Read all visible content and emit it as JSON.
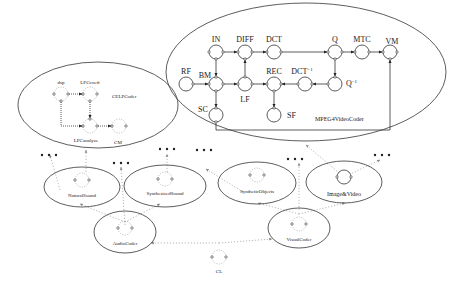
{
  "diagram": {
    "mpeg4": {
      "title": "MPEG4VideoCoder",
      "nodes": {
        "IN": "IN",
        "DIFF": "DIFF",
        "DCT": "DCT",
        "Q": "Q",
        "MTC": "MTC",
        "VM": "VM",
        "RF": "RF",
        "BM": "BM",
        "LF": "LF",
        "REC": "REC",
        "DCTinv": "DCT",
        "DCTinv_sup": "−1",
        "Qinv": "Q",
        "Qinv_sup": "−1",
        "SC": "SC",
        "SF": "SF"
      }
    },
    "celp": {
      "title": "CELPCoder",
      "nodes": {
        "dsp": "dsp",
        "LPCcoeff": "LPCcoeff",
        "LPCanalyze": "LPCanalyze",
        "CM": "CM"
      }
    },
    "hierarchy": {
      "natural_sound": "NaturalSound",
      "synthesized_sound": "SynthesizedSound",
      "synthetic_objects": "SyntheticObjects",
      "image_video": "Image&Video",
      "audio_coder": "AudioCoder",
      "visual_coder": "VisualCoder",
      "cl": "CL"
    }
  }
}
